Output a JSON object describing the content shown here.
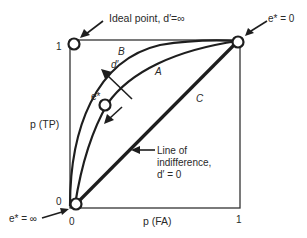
{
  "diagram": {
    "type": "ROC space diagram",
    "axes": {
      "x_label": "p (FA)",
      "y_label": "p (TP)",
      "x_ticks": [
        "0",
        "1"
      ],
      "y_ticks": [
        "0",
        "1"
      ]
    },
    "curves": [
      {
        "id": "B",
        "label": "B",
        "description": "high-sensitivity ROC curve"
      },
      {
        "id": "A",
        "label": "A",
        "description": "moderate-sensitivity ROC curve"
      },
      {
        "id": "C",
        "label": "C",
        "description": "diagonal line"
      }
    ],
    "points": {
      "ideal": "Ideal point, d′=∞",
      "top_right": "e* = 0",
      "bottom_left": "e* = ∞",
      "operating": "e*"
    },
    "arrow_labels": {
      "sensitivity": "d′"
    },
    "annotations": {
      "line_of_indifference_1": "Line of",
      "line_of_indifference_2": "indifference,",
      "line_of_indifference_3": "d′ = 0"
    },
    "colors": {
      "ink": "#1e1e1e",
      "background": "#ffffff"
    }
  }
}
